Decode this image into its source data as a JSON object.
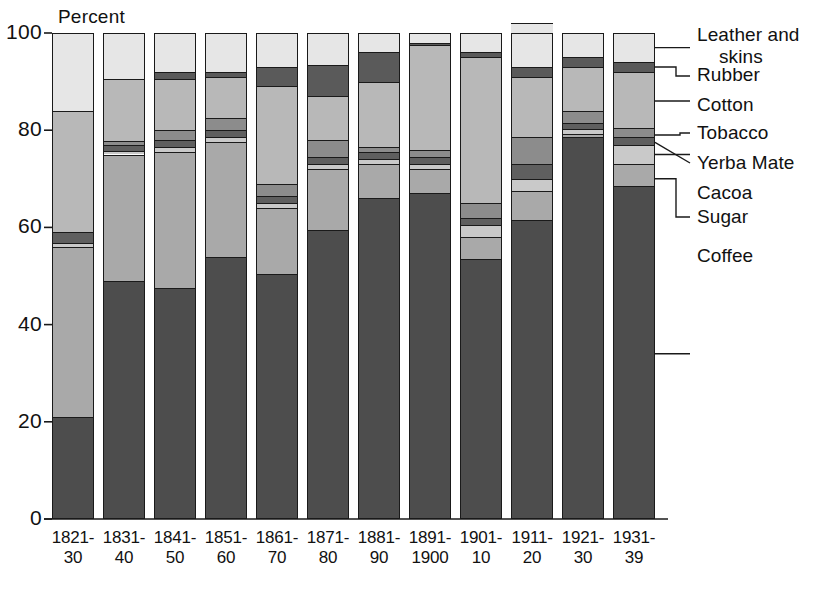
{
  "chart_data": {
    "type": "bar",
    "subtype": "stacked-bar-100",
    "title": "",
    "ylabel": "Percent",
    "xlabel": "",
    "ylim": [
      0,
      100
    ],
    "yticks": [
      0,
      20,
      40,
      60,
      80,
      100
    ],
    "grid": false,
    "legend_position": "right",
    "categories": [
      "1821-30",
      "1831-40",
      "1841-50",
      "1851-60",
      "1861-70",
      "1871-80",
      "1881-90",
      "1891-1900",
      "1901-10",
      "1911-20",
      "1921-30",
      "1931-39"
    ],
    "category_lines": [
      [
        "1821-",
        "30"
      ],
      [
        "1831-",
        "40"
      ],
      [
        "1841-",
        "50"
      ],
      [
        "1851-",
        "60"
      ],
      [
        "1861-",
        "70"
      ],
      [
        "1871-",
        "80"
      ],
      [
        "1881-",
        "90"
      ],
      [
        "1891-",
        "1900"
      ],
      [
        "1901-",
        "10"
      ],
      [
        "1911-",
        "20"
      ],
      [
        "1921-",
        "30"
      ],
      [
        "1931-",
        "39"
      ]
    ],
    "series": [
      {
        "name": "Coffee",
        "color": "#4d4d4d",
        "values": [
          21.0,
          49.0,
          47.5,
          54.0,
          50.5,
          59.5,
          66.0,
          67.0,
          53.5,
          61.5,
          78.5,
          68.5
        ]
      },
      {
        "name": "Sugar",
        "color": "#a9a9a9",
        "values": [
          35.0,
          26.0,
          28.0,
          23.5,
          13.5,
          12.5,
          7.0,
          5.0,
          4.5,
          6.0,
          0.8,
          4.5
        ]
      },
      {
        "name": "Cacoa",
        "color": "#c9c9c9",
        "values": [
          0.8,
          0.8,
          1.0,
          1.0,
          1.0,
          1.0,
          1.0,
          1.0,
          2.5,
          2.5,
          1.0,
          4.0
        ]
      },
      {
        "name": "Yerba Mate",
        "color": "#5f5f5f",
        "values": [
          2.2,
          1.2,
          1.5,
          1.5,
          1.5,
          1.5,
          1.5,
          1.5,
          1.5,
          3.0,
          1.2,
          1.5
        ]
      },
      {
        "name": "Tobacco",
        "color": "#8c8c8c",
        "values": [
          0.0,
          0.8,
          2.0,
          2.5,
          2.5,
          3.5,
          1.0,
          1.5,
          3.0,
          5.5,
          2.5,
          2.0
        ]
      },
      {
        "name": "Cotton",
        "color": "#b8b8b8",
        "values": [
          25.0,
          12.7,
          10.5,
          8.5,
          20.0,
          9.0,
          13.5,
          21.5,
          30.0,
          12.5,
          9.0,
          11.5
        ]
      },
      {
        "name": "Rubber",
        "color": "#5a5a5a",
        "values": [
          0.0,
          0.0,
          1.5,
          1.0,
          4.0,
          6.5,
          6.0,
          0.5,
          1.0,
          2.0,
          2.0,
          2.0
        ]
      },
      {
        "name": "Leather and skins",
        "color": "#e6e6e6",
        "values": [
          16.0,
          9.5,
          8.0,
          8.0,
          7.0,
          6.5,
          4.0,
          2.0,
          4.0,
          9.0,
          5.0,
          6.0
        ]
      }
    ],
    "legend_entries": [
      "Leather and skins",
      "Rubber",
      "Cotton",
      "Tobacco",
      "Yerba Mate",
      "Cacoa",
      "Sugar",
      "Coffee"
    ]
  },
  "legend": {
    "items": [
      {
        "line1": "Leather and",
        "line2": "skins"
      },
      {
        "line1": "Rubber",
        "line2": ""
      },
      {
        "line1": "Cotton",
        "line2": ""
      },
      {
        "line1": "Tobacco",
        "line2": ""
      },
      {
        "line1": "Yerba Mate",
        "line2": ""
      },
      {
        "line1": "Cacoa",
        "line2": ""
      },
      {
        "line1": "Sugar",
        "line2": ""
      },
      {
        "line1": "Coffee",
        "line2": ""
      }
    ]
  },
  "axis": {
    "y_title": "Percent",
    "y_labels": [
      "100",
      "80",
      "60",
      "40",
      "20",
      "0"
    ]
  }
}
